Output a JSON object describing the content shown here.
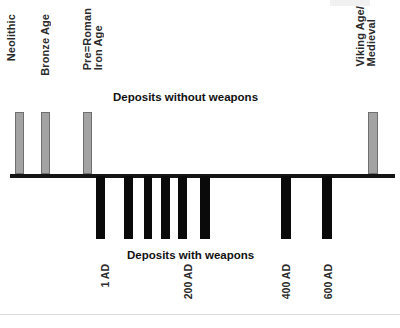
{
  "chart_data": {
    "type": "bar",
    "title": "",
    "subtitle": "",
    "xlabel": "",
    "ylabel": "",
    "orientation": "vertical-diverging",
    "grid": false,
    "legend_position": "none",
    "axis_zero_y_px": 176,
    "series": [
      {
        "name": "Deposits without weapons",
        "direction": "up",
        "color": "#a3a3a3",
        "values": [
          62,
          62,
          62,
          62
        ]
      },
      {
        "name": "Deposits with weapons",
        "direction": "down",
        "color": "#0a0a0a",
        "values": [
          63,
          63,
          63,
          63,
          63,
          63,
          63,
          63
        ]
      }
    ],
    "bars_up": [
      {
        "label": "Neolithic",
        "x": 15,
        "width": 9,
        "height": 62
      },
      {
        "label": "Bronze Age",
        "x": 41,
        "width": 9,
        "height": 62
      },
      {
        "label": "Pre-Roman Iron Age",
        "x": 83,
        "width": 9,
        "height": 62
      },
      {
        "label": "Viking Age/Medieval",
        "x": 368,
        "width": 10,
        "height": 62
      }
    ],
    "bars_down": [
      {
        "x": 96,
        "width": 9,
        "height": 63
      },
      {
        "x": 124,
        "width": 9,
        "height": 63
      },
      {
        "x": 144,
        "width": 8,
        "height": 63
      },
      {
        "x": 161,
        "width": 9,
        "height": 63
      },
      {
        "x": 178,
        "width": 9,
        "height": 63
      },
      {
        "x": 200,
        "width": 10,
        "height": 63
      },
      {
        "x": 281,
        "width": 10,
        "height": 63
      },
      {
        "x": 322,
        "width": 10,
        "height": 63
      }
    ],
    "category_labels": [
      {
        "text": "Neolithic",
        "x": 6,
        "y": 14
      },
      {
        "text": "Bronze Age",
        "x": 40,
        "y": 14
      },
      {
        "text": "Pre=Roman\nIron Age",
        "x": 82,
        "y": 8
      },
      {
        "text": "Viking Age/\nMedieval",
        "x": 355,
        "y": 6
      }
    ],
    "tick_labels": [
      {
        "text": "1 AD",
        "x": 100,
        "y": 264
      },
      {
        "text": "200 AD",
        "x": 183,
        "y": 264
      },
      {
        "text": "400 AD",
        "x": 281,
        "y": 264
      },
      {
        "text": "600 AD",
        "x": 323,
        "y": 264
      }
    ],
    "captions": {
      "upper": "Deposits without weapons",
      "lower": "Deposits with weapons"
    },
    "colors": {
      "bar_up_fill": "#a3a3a3",
      "bar_up_stroke": "#6f6f6f",
      "bar_down_fill": "#0a0a0a",
      "axis": "#151515",
      "text": "#2b2b2b"
    }
  },
  "labels": {
    "neolithic": "Neolithic",
    "bronze_age": "Bronze Age",
    "pre_roman_iron_age": "Pre=Roman\nIron Age",
    "viking_medieval": "Viking Age/\nMedieval",
    "tick_1ad": "1 AD",
    "tick_200ad": "200 AD",
    "tick_400ad": "400 AD",
    "tick_600ad": "600 AD",
    "caption_upper": "Deposits without weapons",
    "caption_lower": "Deposits with weapons"
  }
}
